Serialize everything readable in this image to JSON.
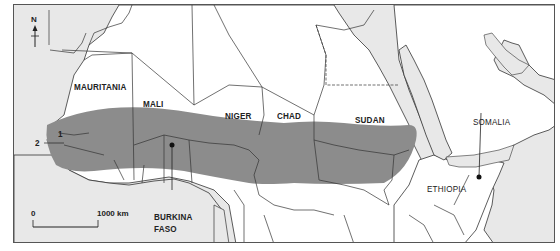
{
  "map": {
    "title": "",
    "colors": {
      "sea": "#e8e8e8",
      "land": "#ffffff",
      "sahel_band": "#8c8c8c",
      "border": "#333333"
    },
    "compass": {
      "label": "N"
    },
    "scale_bar": {
      "start": "0",
      "end": "1000 km"
    },
    "countries": [
      {
        "name": "MAURITANIA"
      },
      {
        "name": "MALI"
      },
      {
        "name": "NIGER"
      },
      {
        "name": "CHAD"
      },
      {
        "name": "SUDAN"
      },
      {
        "name": "SOMALIA"
      },
      {
        "name": "ETHIOPIA"
      },
      {
        "name_line1": "BURKINA",
        "name_line2": "FASO"
      }
    ],
    "callouts": [
      {
        "label": "1"
      },
      {
        "label": "2"
      }
    ],
    "shaded_region": "Sahel belt across West to East Africa"
  }
}
